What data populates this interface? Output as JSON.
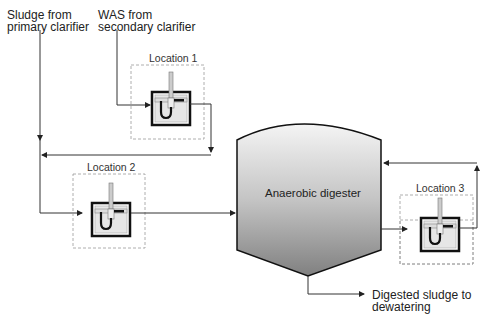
{
  "labels": {
    "primary_line1": "Sludge from",
    "primary_line2": "primary clarifier",
    "was_line1": "WAS from",
    "was_line2": "secondary clarifier",
    "location1": "Location 1",
    "location2": "Location 2",
    "location3": "Location 3",
    "digester": "Anaerobic digester",
    "output_line1": "Digested sludge to",
    "output_line2": "dewatering"
  },
  "colors": {
    "line": "#333333",
    "dashed_box": "#999999",
    "digester_top": "#f2f2f2",
    "digester_bottom": "#8a8a8a"
  }
}
